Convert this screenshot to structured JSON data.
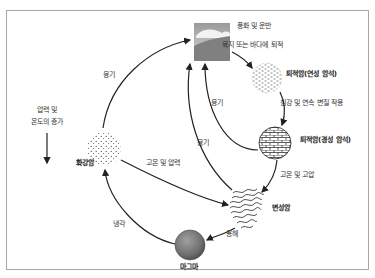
{
  "diagram": {
    "nodes": {
      "surface": {
        "label": "풍화 및 운반",
        "icon": "landscape-icon"
      },
      "sedimentary_soft": {
        "label": "퇴적암(연성 암석)",
        "icon": "loose-sediment-icon"
      },
      "sedimentary_hard": {
        "label": "퇴적암(경성 암석)",
        "icon": "brick-rock-icon"
      },
      "metamorphic": {
        "label": "변성암",
        "icon": "folded-rock-icon"
      },
      "magma": {
        "label": "마그마",
        "icon": "magma-sphere-icon"
      },
      "granite": {
        "label": "화강암",
        "icon": "granite-dots-icon"
      }
    },
    "edges": {
      "deposition": "육지 또는 바다에 퇴적",
      "subsidence": "침강 및 연속 변질 작용",
      "high_temp_pressure": "고온 및 고압",
      "melting": "용해",
      "cooling": "냉각",
      "heat_pressure": "고온 및 압력",
      "uplift_granite": "융기",
      "uplift_soft": "융기",
      "uplift_hard": "융기"
    },
    "side_note": {
      "line1": "압력 및",
      "line2": "온도의 증가"
    }
  }
}
